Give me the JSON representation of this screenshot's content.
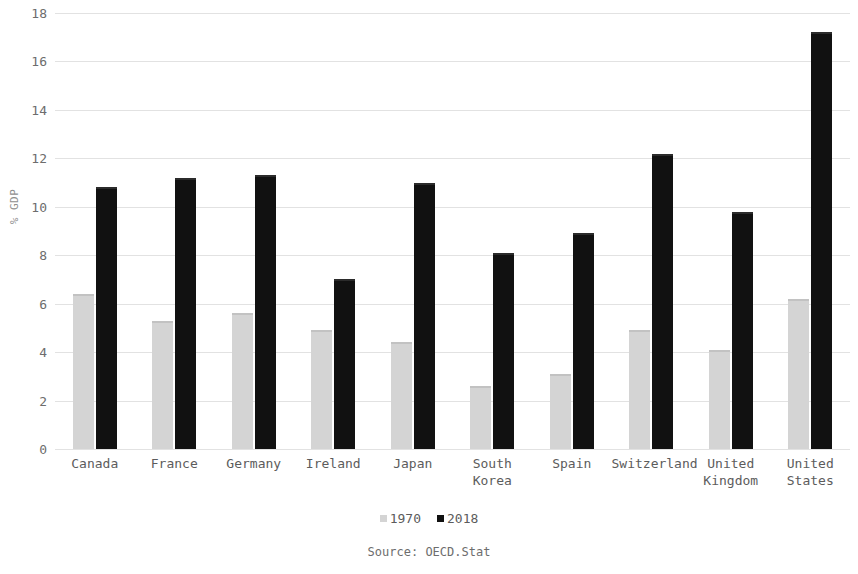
{
  "chart_data": {
    "type": "bar",
    "title": "",
    "subtitle": "",
    "xlabel": "",
    "ylabel": "% GDP",
    "ylim": [
      0,
      18
    ],
    "ytick_step": 2,
    "yticks": [
      "0",
      "2",
      "4",
      "6",
      "8",
      "10",
      "12",
      "14",
      "16",
      "18"
    ],
    "grid": true,
    "legend_position": "bottom",
    "categories": [
      "Canada",
      "France",
      "Germany",
      "Ireland",
      "Japan",
      "South Korea",
      "Spain",
      "Switzerland",
      "United Kingdom",
      "United States"
    ],
    "series": [
      {
        "name": "1970",
        "color": "#d4d4d4",
        "values": [
          6.4,
          5.3,
          5.6,
          4.9,
          4.4,
          2.6,
          3.1,
          4.9,
          4.1,
          6.2
        ]
      },
      {
        "name": "2018",
        "color": "#111111",
        "values": [
          10.8,
          11.2,
          11.3,
          7.0,
          11.0,
          8.1,
          8.9,
          12.2,
          9.8,
          17.2
        ]
      }
    ],
    "annotations": [
      "Source: OECD.Stat"
    ]
  },
  "footer": {
    "source": "Source: OECD.Stat"
  }
}
